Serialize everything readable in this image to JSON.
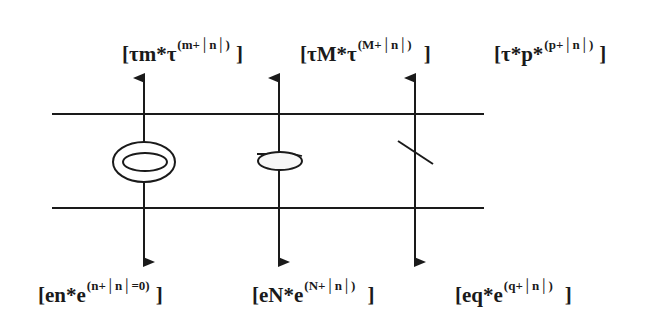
{
  "diagram": {
    "colors": {
      "line": "#1a1a1a",
      "background": "#ffffff"
    },
    "top_labels": [
      {
        "base": "[τm*τ",
        "exponent": "(m+│n│)",
        "close": "]"
      },
      {
        "base": "[τM*τ",
        "exponent": "(M+│n│)",
        "close": "]"
      },
      {
        "base": "[τ*p*",
        "exponent": "(p+│n│)",
        "close": "]"
      }
    ],
    "bottom_labels": [
      {
        "base": "[en*e",
        "exponent": "(n+│n│=0)",
        "close": "]"
      },
      {
        "base": "[eN*e",
        "exponent": "(N+│n│)",
        "close": "]"
      },
      {
        "base": "[eq*e",
        "exponent": "(q+│n│)",
        "close": "]"
      }
    ],
    "elements": [
      {
        "name": "double-ellipse-symbol",
        "column": 1
      },
      {
        "name": "single-ellipse-symbol",
        "column": 2
      },
      {
        "name": "slash-symbol",
        "column": 3
      }
    ]
  }
}
